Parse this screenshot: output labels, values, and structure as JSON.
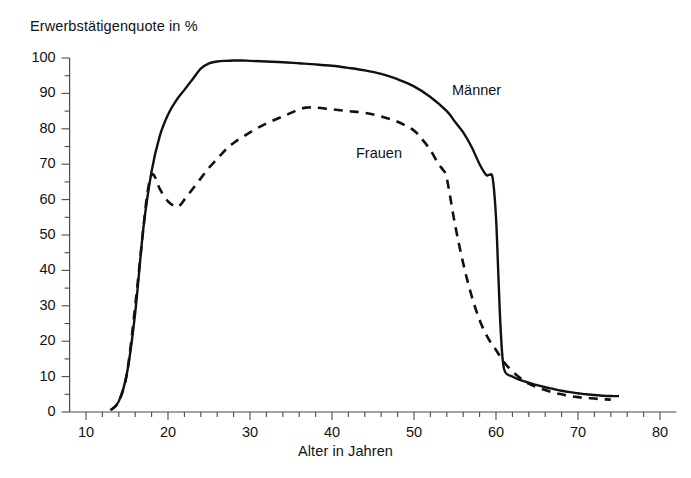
{
  "chart_data": {
    "type": "line",
    "title": "",
    "ylabel": "Erwerbstätigenquote in %",
    "xlabel": "Alter in Jahren",
    "xlim": [
      8,
      82
    ],
    "ylim": [
      0,
      100
    ],
    "xticks": [
      10,
      20,
      30,
      40,
      50,
      60,
      70,
      80
    ],
    "yticks": [
      0,
      10,
      20,
      30,
      40,
      50,
      60,
      70,
      80,
      90,
      100
    ],
    "xticks_minor_step": 2,
    "yticks_minor_step": 5,
    "grid": false,
    "legend": "inline-annotations",
    "series": [
      {
        "name": "Männer",
        "style": "solid",
        "color": "#111111",
        "label_position": {
          "x": 57,
          "y": 91
        },
        "x": [
          13,
          14,
          15,
          16,
          17,
          18,
          19,
          20,
          21,
          22,
          23,
          24,
          25,
          26,
          27,
          28,
          29,
          30,
          32,
          34,
          36,
          38,
          40,
          42,
          44,
          46,
          48,
          50,
          52,
          54,
          55,
          56,
          57,
          58,
          58.8,
          59.2,
          59.6,
          60,
          60.3,
          60.6,
          61,
          62,
          63,
          64,
          65,
          66,
          67,
          68,
          69,
          70,
          71,
          72,
          73,
          74,
          75
        ],
        "y": [
          0.5,
          3,
          11,
          28,
          52,
          68,
          78,
          84,
          88,
          91,
          94,
          97,
          98.5,
          99,
          99.2,
          99.3,
          99.3,
          99.2,
          99,
          98.8,
          98.5,
          98.2,
          97.8,
          97.2,
          96.5,
          95.5,
          94,
          92,
          89,
          85,
          82,
          79,
          75,
          70,
          67,
          67,
          66,
          55,
          38,
          22,
          12,
          10,
          9,
          8.3,
          7.6,
          7,
          6.5,
          6,
          5.6,
          5.3,
          5,
          4.8,
          4.6,
          4.5,
          4.5
        ]
      },
      {
        "name": "Frauen",
        "style": "dashed",
        "color": "#111111",
        "label_position": {
          "x": 43,
          "y": 70
        },
        "x": [
          13,
          14,
          15,
          16,
          17,
          17.5,
          18,
          18.5,
          19,
          20,
          21,
          21.5,
          22,
          23,
          24,
          25,
          26,
          27,
          28,
          30,
          32,
          34,
          36,
          37,
          38,
          40,
          42,
          44,
          46,
          48,
          50,
          51,
          52,
          53,
          53.5,
          54,
          55,
          56,
          57,
          58,
          59,
          60,
          61,
          62,
          63,
          64,
          65,
          66,
          67,
          68,
          69,
          70,
          71,
          72,
          73,
          74
        ],
        "y": [
          0.5,
          3,
          11,
          30,
          52,
          62,
          67,
          66,
          63,
          59.5,
          58,
          58.5,
          60,
          63,
          66,
          69,
          71.5,
          74,
          76,
          79,
          81.5,
          83.5,
          85.5,
          86,
          86,
          85.5,
          85,
          84.5,
          83.5,
          82,
          79.5,
          77,
          74,
          70,
          68.5,
          66,
          53,
          42,
          33,
          26,
          21,
          17.5,
          14,
          11.5,
          9.5,
          8,
          7,
          6.2,
          5.5,
          5,
          4.5,
          4.2,
          4,
          3.8,
          3.6,
          3.5
        ]
      }
    ]
  }
}
